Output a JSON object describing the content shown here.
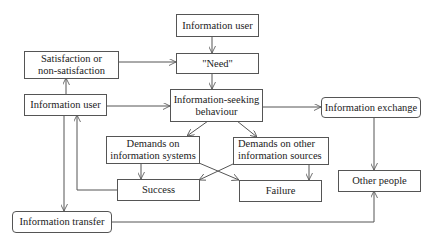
{
  "diagram": {
    "type": "flowchart",
    "nodes": {
      "info_user_top": "Information user",
      "need": "\"Need\"",
      "satisfaction": "Satisfaction or non-satisfaction",
      "info_user_left": "Information user",
      "seeking": "Information-seeking behaviour",
      "exchange": "Information exchange",
      "demands_systems": "Demands on information systems",
      "demands_other": "Demands on other information sources",
      "success": "Success",
      "failure": "Failure",
      "other_people": "Other people",
      "transfer": "Information transfer"
    },
    "lines": {
      "satisfaction_1": "Satisfaction or",
      "satisfaction_2": "non-satisfaction",
      "seeking_1": "Information-seeking",
      "seeking_2": "behaviour",
      "systems_1": "Demands on",
      "systems_2": "information systems",
      "other_1": "Demands on other",
      "other_2": "information sources"
    },
    "edges": [
      [
        "Information user (top)",
        "\"Need\""
      ],
      [
        "\"Need\"",
        "Information-seeking behaviour"
      ],
      [
        "Satisfaction or non-satisfaction",
        "\"Need\""
      ],
      [
        "Information user (left)",
        "Satisfaction or non-satisfaction"
      ],
      [
        "Information user (left)",
        "Information-seeking behaviour"
      ],
      [
        "Information-seeking behaviour",
        "Information exchange"
      ],
      [
        "Information-seeking behaviour",
        "Demands on information systems"
      ],
      [
        "Information-seeking behaviour",
        "Demands on other information sources"
      ],
      [
        "Demands on information systems",
        "Success"
      ],
      [
        "Demands on information systems",
        "Failure"
      ],
      [
        "Demands on other information sources",
        "Success"
      ],
      [
        "Demands on other information sources",
        "Failure"
      ],
      [
        "Success",
        "Information user (left)"
      ],
      [
        "Information user (left)",
        "Information transfer"
      ],
      [
        "Information transfer",
        "Other people"
      ],
      [
        "Information exchange",
        "Other people"
      ]
    ]
  }
}
